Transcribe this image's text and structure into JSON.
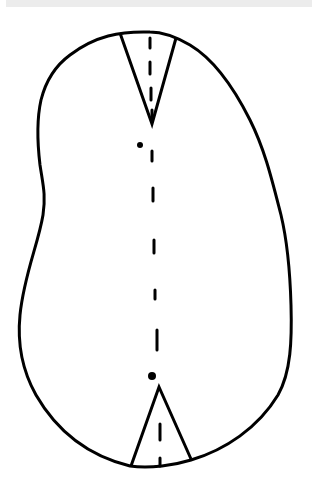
{
  "figure": {
    "type": "line-drawing",
    "stroke_color": "#000000",
    "background_color": "#ffffff",
    "top_band_color": "#ececec",
    "outline_path": "M150,32 C120,31 95,36 70,55 C55,66 46,80 41,100 C37,118 37,140 40,165 C43,185 46,195 43,215 C38,245 24,275 20,315 C17,345 22,370 36,395 C55,428 85,455 130,466 C150,469 175,465 191,460 C225,450 258,428 278,395 C291,372 292,340 291,305 C290,270 287,240 281,215 C272,180 265,150 250,120 C235,90 215,60 190,45 C178,38 165,32 150,32 Z",
    "top_notch": {
      "left": [
        120,
        33
      ],
      "tip": [
        152,
        124
      ],
      "right": [
        176,
        38
      ]
    },
    "bottom_notch": {
      "left": [
        131,
        466
      ],
      "tip": [
        159,
        387
      ],
      "right": [
        191,
        459
      ]
    },
    "dots": [
      {
        "x": 140,
        "y": 145,
        "r": 3
      },
      {
        "x": 152,
        "y": 376,
        "r": 4
      }
    ],
    "dashes": [
      [
        150,
        38,
        150,
        48
      ],
      [
        150,
        62,
        150,
        74
      ],
      [
        151,
        88,
        151,
        100
      ],
      [
        152,
        110,
        152,
        118
      ],
      [
        152,
        151,
        152,
        161
      ],
      [
        153,
        188,
        153,
        201
      ],
      [
        154,
        240,
        154,
        253
      ],
      [
        155,
        290,
        155,
        299
      ],
      [
        157,
        330,
        157,
        350
      ],
      [
        160,
        424,
        160,
        440
      ],
      [
        160,
        458,
        160,
        466
      ]
    ]
  }
}
